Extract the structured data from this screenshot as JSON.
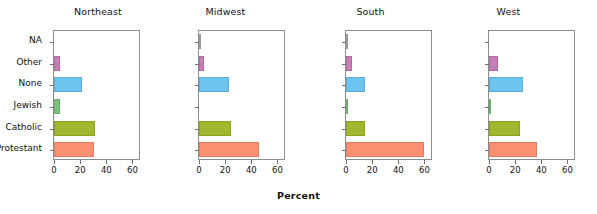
{
  "chart_data": {
    "type": "bar",
    "orientation": "horizontal",
    "title": "",
    "xlabel": "Percent",
    "ylabel": "",
    "xlim": [
      0,
      65
    ],
    "xticks": [
      0,
      20,
      40,
      60
    ],
    "xticklabels": [
      "0",
      "20",
      "40",
      "60"
    ],
    "grid": false,
    "legend": "none",
    "categories": [
      "Protestant",
      "Catholic",
      "Jewish",
      "None",
      "Other",
      "NA"
    ],
    "category_order_top_to_bottom": [
      "NA",
      "Other",
      "None",
      "Jewish",
      "Catholic",
      "Protestant"
    ],
    "panels": [
      "Northeast",
      "Midwest",
      "South",
      "West"
    ],
    "series": [
      {
        "name": "Northeast",
        "values": [
          31.0,
          32.3,
          5.0,
          22.0,
          5.0,
          0.0
        ]
      },
      {
        "name": "Midwest",
        "values": [
          47.0,
          25.0,
          0.0,
          23.5,
          3.8,
          0.4
        ]
      },
      {
        "name": "South",
        "values": [
          61.0,
          14.5,
          0.6,
          15.0,
          4.8,
          0.3
        ]
      },
      {
        "name": "West",
        "values": [
          37.5,
          24.5,
          1.6,
          27.0,
          7.0,
          0.0
        ]
      }
    ],
    "colors": {
      "Protestant": "#fb8f72",
      "Catholic": "#9fb82e",
      "Jewish": "#7cc47c",
      "None": "#6cc4ef",
      "Other": "#c77db5",
      "NA": "#b0b0b0"
    }
  },
  "axis": {
    "x_title": "Percent"
  },
  "panel_titles": {
    "p0": "Northeast",
    "p1": "Midwest",
    "p2": "South",
    "p3": "West"
  },
  "y_categories": {
    "c0": "NA",
    "c1": "Other",
    "c2": "None",
    "c3": "Jewish",
    "c4": "Catholic",
    "c5": "Protestant"
  },
  "x_ticks": {
    "t0": "0",
    "t1": "20",
    "t2": "40",
    "t3": "60"
  }
}
